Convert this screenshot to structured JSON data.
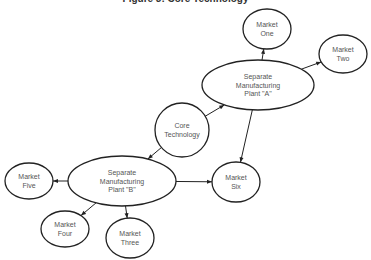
{
  "title": "Figure 3: Core Technology",
  "colors": {
    "stroke": "#222222",
    "text": "#555555",
    "background": "#ffffff"
  },
  "nodes": [
    {
      "id": "core",
      "lines": [
        "Core",
        "Technology"
      ],
      "cx": 182,
      "cy": 130,
      "rx": 27,
      "ry": 27
    },
    {
      "id": "plantA",
      "lines": [
        "Separate",
        "Manufacturing",
        "Plant \"A\""
      ],
      "cx": 258,
      "cy": 85,
      "rx": 56,
      "ry": 25
    },
    {
      "id": "plantB",
      "lines": [
        "Separate",
        "Manufacturing",
        "Plant \"B\""
      ],
      "cx": 122,
      "cy": 181,
      "rx": 54,
      "ry": 25
    },
    {
      "id": "m1",
      "lines": [
        "Market",
        "One"
      ],
      "cx": 267,
      "cy": 29,
      "rx": 24,
      "ry": 20
    },
    {
      "id": "m2",
      "lines": [
        "Market",
        "Two"
      ],
      "cx": 343,
      "cy": 54,
      "rx": 24,
      "ry": 19
    },
    {
      "id": "m3",
      "lines": [
        "Market",
        "Three"
      ],
      "cx": 130,
      "cy": 238,
      "rx": 24,
      "ry": 20
    },
    {
      "id": "m4",
      "lines": [
        "Market",
        "Four"
      ],
      "cx": 65,
      "cy": 229,
      "rx": 24,
      "ry": 18
    },
    {
      "id": "m5",
      "lines": [
        "Market",
        "Five"
      ],
      "cx": 29,
      "cy": 181,
      "rx": 24,
      "ry": 18
    },
    {
      "id": "m6",
      "lines": [
        "Market",
        "Six"
      ],
      "cx": 236,
      "cy": 182,
      "rx": 24,
      "ry": 20
    }
  ],
  "edges": [
    {
      "from": "core",
      "to": "plantA"
    },
    {
      "from": "core",
      "to": "plantB"
    },
    {
      "from": "plantA",
      "to": "m1"
    },
    {
      "from": "plantA",
      "to": "m2"
    },
    {
      "from": "plantA",
      "to": "m6"
    },
    {
      "from": "plantB",
      "to": "m6"
    },
    {
      "from": "plantB",
      "to": "m5"
    },
    {
      "from": "plantB",
      "to": "m4"
    },
    {
      "from": "plantB",
      "to": "m3"
    }
  ]
}
